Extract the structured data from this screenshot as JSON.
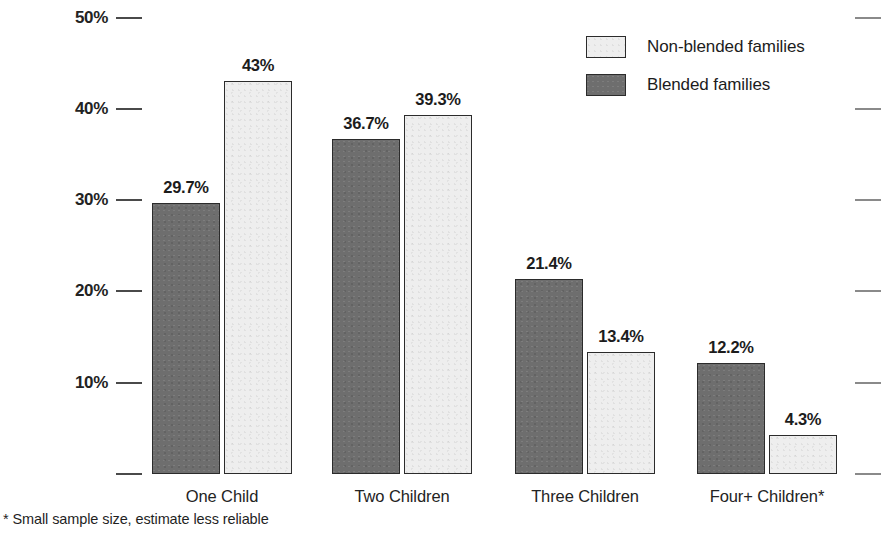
{
  "chart_data": {
    "type": "bar",
    "title": "",
    "subtitle": "",
    "xlabel": "",
    "ylabel": "",
    "grid": false,
    "legend_position": "top-right",
    "categories": [
      "One Child",
      "Two Children",
      "Three Children",
      "Four+ Children*"
    ],
    "ylim": [
      0,
      50
    ],
    "ytick_values": [
      0,
      10,
      20,
      30,
      40,
      50
    ],
    "ytick_labels": [
      "",
      "10%",
      "20%",
      "30%",
      "40%",
      "50%"
    ],
    "series": [
      {
        "name": "Blended families",
        "color": "#6e6e6e",
        "values": [
          29.7,
          36.7,
          21.4,
          12.2
        ],
        "data_labels": [
          "29.7%",
          "36.7%",
          "21.4%",
          "12.2%"
        ]
      },
      {
        "name": "Non-blended families",
        "color": "#eeeeee",
        "values": [
          43.0,
          39.3,
          13.4,
          4.3
        ],
        "data_labels": [
          "43%",
          "39.3%",
          "13.4%",
          "4.3%"
        ]
      }
    ],
    "annotations": [
      "* Small sample size, estimate less reliable"
    ]
  },
  "legend": {
    "entries": [
      {
        "label": "Non-blended families",
        "swatch": "light"
      },
      {
        "label": "Blended families",
        "swatch": "dark"
      }
    ]
  },
  "footnote": {
    "text": "* Small sample size, estimate less reliable"
  },
  "colors": {
    "blended": "#6e6e6e",
    "non_blended": "#eeeeee",
    "outline": "#2b2b2b",
    "text": "#1c1c1c",
    "tick": "#4a4a4a",
    "tick_right": "#8a8a8a",
    "background": "#ffffff"
  }
}
